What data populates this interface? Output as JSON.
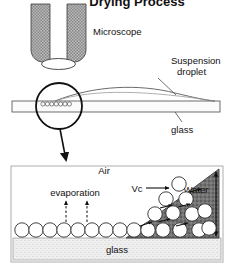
{
  "figure": {
    "title": "Drying Process",
    "title_clipped": true
  },
  "panel_top": {
    "microscope_label": "Microscope",
    "droplet_label_line1": "Suspension",
    "droplet_label_line2": "droplet",
    "glass_label": "glass",
    "magnifier": {
      "particle_count": 7,
      "note_icon": "magnifier-circle"
    },
    "objective": {
      "wall_fill": "#a8a8a8",
      "wall_pattern": "stipple-hatch"
    }
  },
  "panel_detail": {
    "air_label": "Air",
    "evaporation_label": "evaporation",
    "vc_label": "Vc",
    "water_label": "Water",
    "glass_label": "glass",
    "evaporation_arrow_count": 2,
    "monolayer_particle_count": 10,
    "suspended_particle_count": 11,
    "flow_arrow_count": 6,
    "height_marker": "double-headed-vertical-arrow"
  },
  "colors": {
    "ink": "#111111",
    "water_fill": "#6e6e6e",
    "glass_fill": "#e9e9e9",
    "objective_fill": "#a8a8a8",
    "particle_fill": "#ffffff",
    "background": "#ffffff"
  }
}
